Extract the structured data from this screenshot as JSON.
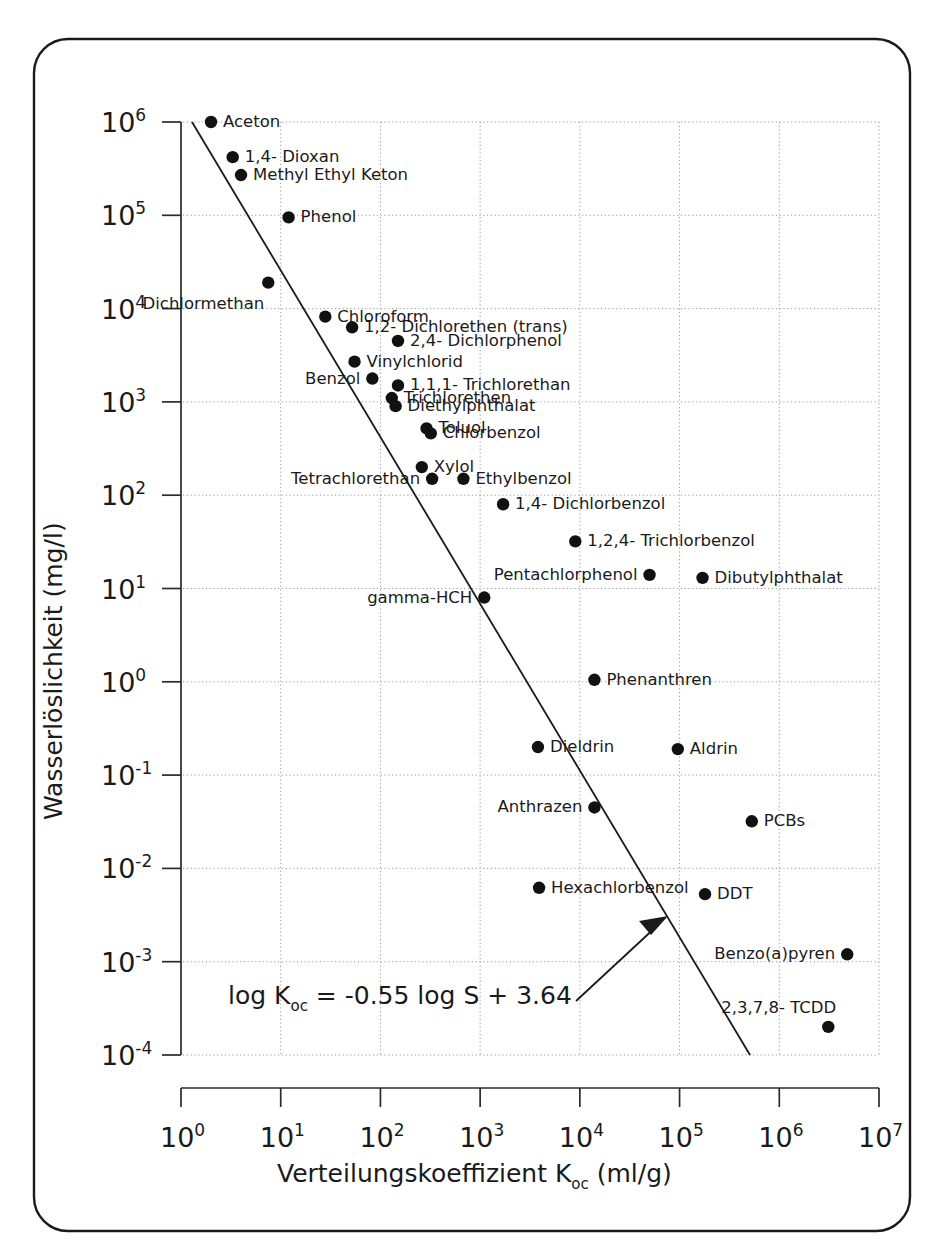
{
  "chart_data": {
    "type": "scatter",
    "title": "",
    "xlabel": "Verteilungskoeffizient K",
    "xlabel_sub": "oc",
    "xlabel_unit": " (ml/g)",
    "ylabel": "Wasserlöslichkeit (mg/l)",
    "xlim": [
      1,
      10000000
    ],
    "ylim": [
      0.0001,
      1000000
    ],
    "xscale": "log",
    "yscale": "log",
    "grid": true,
    "legend": "none",
    "x_tick_labels": [
      "10",
      "10",
      "10",
      "10",
      "10",
      "10",
      "10",
      "10"
    ],
    "x_tick_exponents": [
      "0",
      "1",
      "2",
      "3",
      "4",
      "5",
      "6",
      "7"
    ],
    "y_tick_labels": [
      "10",
      "10",
      "10",
      "10",
      "10",
      "10",
      "10",
      "10",
      "10",
      "10",
      "10"
    ],
    "y_tick_exponents": [
      "6",
      "5",
      "4",
      "3",
      "2",
      "1",
      "0",
      "-1",
      "-2",
      "-3",
      "-4"
    ],
    "annotation": {
      "equation_main_1": "log K",
      "equation_sub": "oc",
      "equation_main_2": " = -0.55 log S + 3.64",
      "arrow_points_to": "regression-line"
    },
    "regression": {
      "slope_note": "log Koc = -0.55 log S + 3.64",
      "x_start": 2.0,
      "y_start": 1000000,
      "x_end": 320000,
      "y_end": 0.0001
    },
    "points": [
      {
        "name": "Aceton",
        "koc": 2.0,
        "solubility": 1000000,
        "label": "Aceton",
        "label_pos": "right"
      },
      {
        "name": "1,4- Dioxan",
        "koc": 3.3,
        "solubility": 420000,
        "label": "1,4- Dioxan",
        "label_pos": "right"
      },
      {
        "name": "Methyl Ethyl Keton",
        "koc": 4.0,
        "solubility": 270000,
        "label": "Methyl Ethyl Keton",
        "label_pos": "right"
      },
      {
        "name": "Phenol",
        "koc": 12.0,
        "solubility": 95000,
        "label": "Phenol",
        "label_pos": "right"
      },
      {
        "name": "Dichlormethan",
        "koc": 7.5,
        "solubility": 19000,
        "label": "Dichlormethan",
        "label_pos": "below-left"
      },
      {
        "name": "Chloroform",
        "koc": 28.0,
        "solubility": 8200,
        "label": "Chloroform",
        "label_pos": "right"
      },
      {
        "name": "1,2- Dichlorethen (trans)",
        "koc": 52.0,
        "solubility": 6300,
        "label": "1,2- Dichlorethen (trans)",
        "label_pos": "right"
      },
      {
        "name": "2,4- Dichlorphenol",
        "koc": 150.0,
        "solubility": 4500,
        "label": "2,4- Dichlorphenol",
        "label_pos": "right"
      },
      {
        "name": "Vinylchlorid",
        "koc": 55.0,
        "solubility": 2700,
        "label": "Vinylchlorid",
        "label_pos": "right"
      },
      {
        "name": "Benzol",
        "koc": 83.0,
        "solubility": 1780,
        "label": "Benzol",
        "label_pos": "left"
      },
      {
        "name": "1,1,1- Trichlorethan",
        "koc": 150.0,
        "solubility": 1500,
        "label": "1,1,1- Trichlorethan",
        "label_pos": "right"
      },
      {
        "name": "Trichlorethen",
        "koc": 130.0,
        "solubility": 1100,
        "label": "Trichlorethen",
        "label_pos": "right"
      },
      {
        "name": "Diethylphthalat",
        "koc": 142.0,
        "solubility": 900,
        "label": "Diethylphthalat",
        "label_pos": "right"
      },
      {
        "name": "Toluol",
        "koc": 290.0,
        "solubility": 520,
        "label": "Toluol",
        "label_pos": "right"
      },
      {
        "name": "Chlorbenzol",
        "koc": 320.0,
        "solubility": 460,
        "label": "Chlorbenzol",
        "label_pos": "right"
      },
      {
        "name": "Xylol",
        "koc": 260.0,
        "solubility": 200,
        "label": "Xylol",
        "label_pos": "right"
      },
      {
        "name": "Tetrachlorethan",
        "koc": 330.0,
        "solubility": 150,
        "label": "Tetrachlorethan",
        "label_pos": "left"
      },
      {
        "name": "Ethylbenzol",
        "koc": 680.0,
        "solubility": 150,
        "label": "Ethylbenzol",
        "label_pos": "right"
      },
      {
        "name": "1,4- Dichlorbenzol",
        "koc": 1700.0,
        "solubility": 80,
        "label": "1,4- Dichlorbenzol",
        "label_pos": "right"
      },
      {
        "name": "1,2,4- Trichlorbenzol",
        "koc": 9000.0,
        "solubility": 32,
        "label": "1,2,4- Trichlorbenzol",
        "label_pos": "right"
      },
      {
        "name": "Pentachlorphenol",
        "koc": 50000.0,
        "solubility": 14,
        "label": "Pentachlorphenol",
        "label_pos": "left"
      },
      {
        "name": "Dibutylphthalat",
        "koc": 170000.0,
        "solubility": 13,
        "label": "Dibutylphthalat",
        "label_pos": "right"
      },
      {
        "name": "gamma-HCH",
        "koc": 1100.0,
        "solubility": 8,
        "label": "gamma-HCH",
        "label_pos": "left"
      },
      {
        "name": "Phenanthren",
        "koc": 14000.0,
        "solubility": 1.05,
        "label": "Phenanthren",
        "label_pos": "right"
      },
      {
        "name": "Dieldrin",
        "koc": 3800.0,
        "solubility": 0.2,
        "label": "Dieldrin",
        "label_pos": "right"
      },
      {
        "name": "Aldrin",
        "koc": 96000.0,
        "solubility": 0.19,
        "label": "Aldrin",
        "label_pos": "right"
      },
      {
        "name": "Anthrazen",
        "koc": 14000.0,
        "solubility": 0.045,
        "label": "Anthrazen",
        "label_pos": "left"
      },
      {
        "name": "PCBs",
        "koc": 530000.0,
        "solubility": 0.032,
        "label": "PCBs",
        "label_pos": "right"
      },
      {
        "name": "Hexachlorbenzol",
        "koc": 3900.0,
        "solubility": 0.0062,
        "label": "Hexachlorbenzol",
        "label_pos": "right"
      },
      {
        "name": "DDT",
        "koc": 180000.0,
        "solubility": 0.0053,
        "label": "DDT",
        "label_pos": "right"
      },
      {
        "name": "Benzo(a)pyren",
        "koc": 4800000.0,
        "solubility": 0.0012,
        "label": "Benzo(a)pyren",
        "label_pos": "left"
      },
      {
        "name": "2,3,7,8- TCDD",
        "koc": 3100000.0,
        "solubility": 0.0002,
        "label": "2,3,7,8- TCDD",
        "label_pos": "above"
      }
    ]
  },
  "colors": {
    "marker": "#111111",
    "line": "#1a1a1a",
    "grid": "#9a9a9a",
    "background": "#ffffff",
    "frame": "#1a1a1a"
  }
}
